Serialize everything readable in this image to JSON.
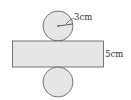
{
  "diagram": {
    "type": "cylinder-net",
    "colors": {
      "fill": "#e6e6e6",
      "stroke": "#555555",
      "background": "#ffffff"
    },
    "top_circle": {
      "radius_label": "3cm"
    },
    "rectangle": {
      "height_label": "5cm"
    },
    "bottom_circle": {}
  }
}
